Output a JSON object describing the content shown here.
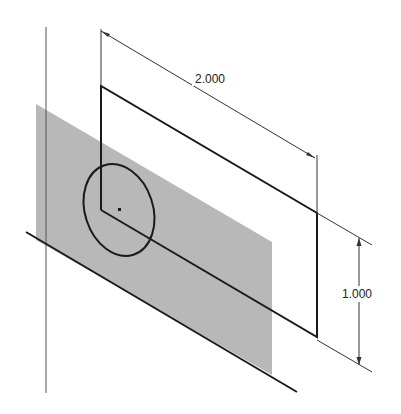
{
  "drawing": {
    "dimensions": {
      "width_label": "2.000",
      "height_label": "1.000"
    },
    "colors": {
      "line": "#1a1a1a",
      "dim_line": "#333333",
      "plane_fill": "#b4b4b4",
      "background": "#ffffff"
    }
  }
}
